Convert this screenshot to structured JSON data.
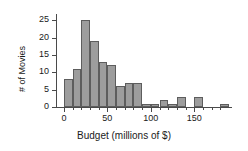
{
  "chart_data": {
    "type": "bar",
    "title": "",
    "subtitle": "",
    "xlabel": "Budget (millions of $)",
    "ylabel": "# of Movies",
    "xlim": [
      -8,
      190
    ],
    "ylim": [
      0,
      26
    ],
    "grid": false,
    "legend": null,
    "bin_width": 10,
    "bin_starts": [
      0,
      10,
      20,
      30,
      40,
      50,
      60,
      70,
      80,
      90,
      100,
      110,
      120,
      130,
      140,
      150,
      160,
      170,
      180
    ],
    "categories": [
      "0-10",
      "10-20",
      "20-30",
      "30-40",
      "40-50",
      "50-60",
      "60-70",
      "70-80",
      "80-90",
      "90-100",
      "100-110",
      "110-120",
      "120-130",
      "130-140",
      "140-150",
      "150-160",
      "160-170",
      "170-180",
      "180-190"
    ],
    "values": [
      8,
      11,
      25,
      19,
      13,
      12,
      6,
      7,
      7,
      1,
      1,
      2,
      1,
      3,
      0,
      3,
      0,
      0,
      1
    ],
    "x_ticks": [
      0,
      50,
      100,
      150
    ],
    "x_tick_labels": [
      "0",
      "50",
      "100",
      "150"
    ],
    "x_minor_ticks": [
      10,
      20,
      30,
      40,
      60,
      70,
      80,
      90,
      110,
      120,
      130,
      140,
      160,
      170,
      180
    ],
    "y_ticks": [
      0,
      5,
      10,
      15,
      20,
      25
    ],
    "y_tick_labels": [
      "0",
      "5",
      "10",
      "15",
      "20",
      "25"
    ],
    "colors": {
      "bar_fill": "#9d9d9d",
      "bar_edge": "#5d5d5d",
      "axis": "#4a4a4a",
      "text": "#1a1a1a",
      "background": "#ffffff"
    }
  }
}
